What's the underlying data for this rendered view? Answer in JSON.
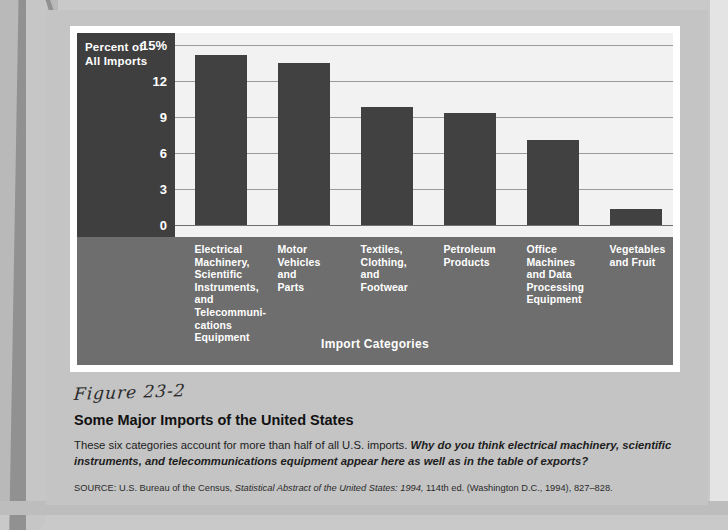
{
  "chart_data": {
    "type": "bar",
    "title": "Some Major Imports of the United States",
    "ylabel": "Percent of All Imports",
    "xlabel": "Import Categories",
    "ylim": [
      0,
      15
    ],
    "yticks": [
      "15%",
      "12",
      "9",
      "6",
      "3",
      "0"
    ],
    "ytick_values": [
      15,
      12,
      9,
      6,
      3,
      0
    ],
    "grid": true,
    "legend": "none",
    "categories": [
      "Electrical Machinery, Scientific Instruments, and Telecommunications Equipment",
      "Motor Vehicles and Parts",
      "Textiles, Clothing, and Footwear",
      "Petroleum Products",
      "Office Machines and Data Processing Equipment",
      "Vegetables and Fruit"
    ],
    "values": [
      14.2,
      13.5,
      9.8,
      9.3,
      7.1,
      1.3
    ],
    "bar_color": "#414141"
  },
  "chart": {
    "y_axis_title_line1": "Percent of",
    "y_axis_title_line2": "All Imports",
    "x_axis_title": "Import Categories",
    "bars": [
      {
        "label_lines": [
          "Electrical",
          "Machinery,",
          "Scientific",
          "Instruments,",
          "and",
          "Telecommuni-",
          "cations",
          "Equipment"
        ],
        "value": 14.2
      },
      {
        "label_lines": [
          "Motor",
          "Vehicles",
          "and",
          "Parts"
        ],
        "value": 13.5
      },
      {
        "label_lines": [
          "Textiles,",
          "Clothing,",
          "and",
          "Footwear"
        ],
        "value": 9.8
      },
      {
        "label_lines": [
          "Petroleum",
          "Products"
        ],
        "value": 9.3
      },
      {
        "label_lines": [
          "Office",
          "Machines",
          "and Data",
          "Processing",
          "Equipment"
        ],
        "value": 7.1
      },
      {
        "label_lines": [
          "Vegetables",
          "and Fruit"
        ],
        "value": 1.3
      }
    ]
  },
  "figure": {
    "number": "Figure 23-2",
    "title": "Some Major Imports of the United States",
    "caption_plain_1": "These six categories account for more than half of all U.S. imports. ",
    "caption_bold": "Why do you think electrical machinery, scientific instruments, and telecommunications equipment appear here as well as in the table of exports?",
    "source_prefix": "SOURCE: U.S. Bureau of the Census, ",
    "source_italic": "Statistical Abstract of the United States: 1994,",
    "source_suffix": " 114th ed. (Washington D.C., 1994), 827–828."
  },
  "colors": {
    "bar": "#414141",
    "axis_panel": "#3f3f3f",
    "category_band": "#6e6e6e",
    "plot_background": "#f2f2f2",
    "page": "#c4c4c4"
  }
}
